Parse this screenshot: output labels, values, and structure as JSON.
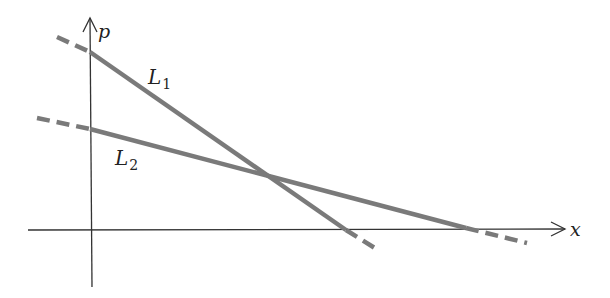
{
  "diagram": {
    "axes": {
      "x_label": "x",
      "y_label": "p",
      "origin": [
        90,
        230
      ],
      "x_axis_end": [
        565,
        229
      ],
      "y_axis_top": [
        90,
        18
      ],
      "y_axis_bottom": [
        92,
        287
      ],
      "x_axis_start": [
        28,
        230
      ],
      "color": "#333333"
    },
    "lines": [
      {
        "name": "L1",
        "label_main": "L",
        "label_sub": "1",
        "label_pos": [
          148,
          84
        ],
        "color": "#7a7a7a",
        "dashed_start": [
          [
            57,
            37
          ],
          [
            90,
            52
          ]
        ],
        "solid": [
          [
            90,
            52
          ],
          [
            346,
            230
          ]
        ],
        "dashed_end": [
          [
            346,
            230
          ],
          [
            378,
            250
          ]
        ]
      },
      {
        "name": "L2",
        "label_main": "L",
        "label_sub": "2",
        "label_pos": [
          115,
          165
        ],
        "color": "#7a7a7a",
        "dashed_start": [
          [
            37,
            118
          ],
          [
            90,
            129
          ]
        ],
        "solid": [
          [
            90,
            129
          ],
          [
            466,
            228
          ]
        ],
        "dashed_end": [
          [
            466,
            228
          ],
          [
            527,
            243
          ]
        ]
      }
    ],
    "intersection": [
      272,
      178
    ]
  }
}
